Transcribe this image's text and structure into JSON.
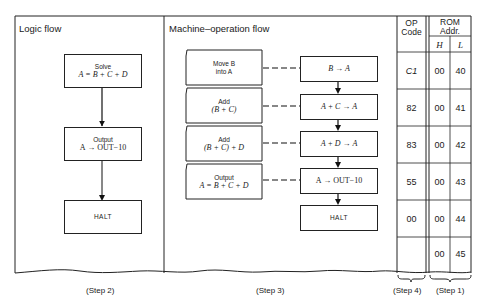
{
  "panels": {
    "logic": {
      "title": "Logic flow",
      "step": "(Step 2)",
      "boxes": [
        {
          "label": "Solve",
          "expr": "A = B + C + D"
        },
        {
          "label": "Output",
          "expr": "A → OUT−10"
        },
        {
          "label": "HALT"
        }
      ]
    },
    "machine": {
      "title": "Machine–operation flow",
      "step": "(Step 3)",
      "ops": [
        {
          "label": "Move B",
          "label2": "into A",
          "action": "B → A"
        },
        {
          "label": "Add",
          "label2": "(B + C)",
          "action": "A + C → A"
        },
        {
          "label": "Add",
          "label2": "(B + C) + D",
          "action": "A + D → A"
        },
        {
          "label": "Output",
          "label2": "A = B + C + D",
          "action": "A → OUT−10"
        }
      ],
      "halt": "HALT"
    },
    "table": {
      "op_header_1": "OP",
      "op_header_2": "Code",
      "rom_header_1": "ROM",
      "rom_header_2": "Addr.",
      "h_header": "H",
      "l_header": "L",
      "rows": [
        {
          "op": "C1",
          "h": "00",
          "l": "40"
        },
        {
          "op": "82",
          "h": "00",
          "l": "41"
        },
        {
          "op": "83",
          "h": "00",
          "l": "42"
        },
        {
          "op": "55",
          "h": "00",
          "l": "43"
        },
        {
          "op": "00",
          "h": "00",
          "l": "44"
        },
        {
          "op": "",
          "h": "00",
          "l": "45"
        }
      ],
      "step_op": "(Step 4)",
      "step_rom": "(Step 1)"
    }
  }
}
